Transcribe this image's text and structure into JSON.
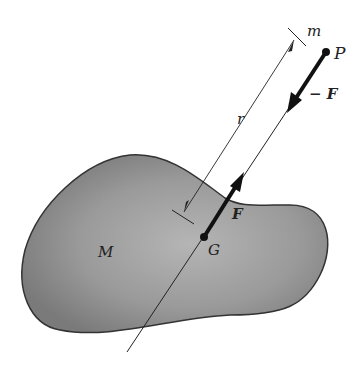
{
  "labels": {
    "m": "m",
    "P": "P",
    "negF": "− F",
    "r": "r",
    "F": "F",
    "G": "G",
    "M": "M"
  },
  "colors": {
    "body_fill": "#8a8a8a",
    "body_outline": "#333333",
    "ink": "#1a1a1a"
  }
}
